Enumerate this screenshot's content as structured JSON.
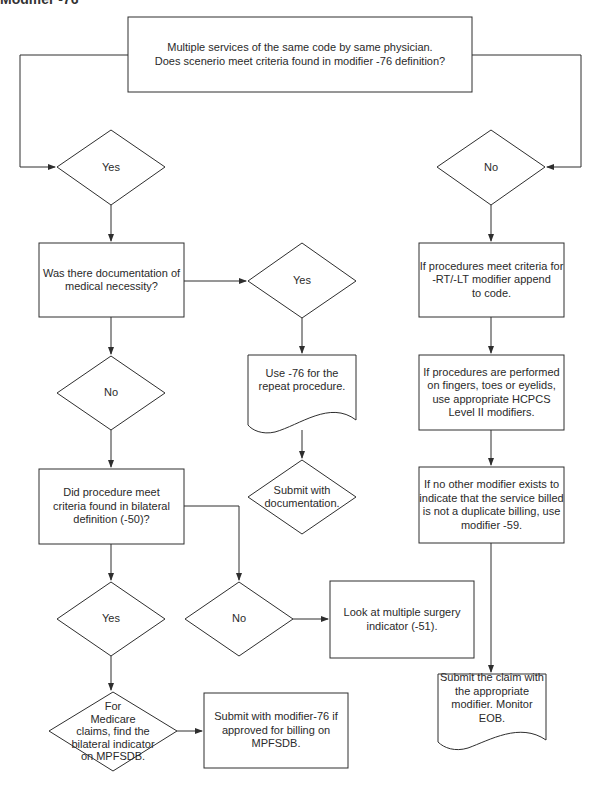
{
  "heading": "Modifier -76",
  "nodes": {
    "start": {
      "type": "process",
      "text": "Multiple services of the same code by same physician.\nDoes scenerio meet criteria found in modifier -76 definition?"
    },
    "yes1": {
      "type": "decision",
      "text": "Yes"
    },
    "no1": {
      "type": "decision",
      "text": "No"
    },
    "med_necessity": {
      "type": "process",
      "text": "Was there documentation of\nmedical necessity?"
    },
    "yes2": {
      "type": "decision",
      "text": "Yes"
    },
    "use76": {
      "type": "document",
      "text": "Use -76 for the\nrepeat procedure."
    },
    "submit_doc": {
      "type": "decision",
      "text": "Submit with\ndocumentation."
    },
    "no2": {
      "type": "decision",
      "text": "No"
    },
    "bilateral": {
      "type": "process",
      "text": "Did procedure meet\ncriteria found in bilateral\ndefinition (-50)?"
    },
    "yes3": {
      "type": "decision",
      "text": "Yes"
    },
    "no3": {
      "type": "decision",
      "text": "No"
    },
    "multi_surgery": {
      "type": "process",
      "text": "Look at multiple surgery\nindicator (-51)."
    },
    "medicare": {
      "type": "decision",
      "text": "For\nMedicare\nclaims, find the\nbilateral indicator\non MPFSDB."
    },
    "submit76": {
      "type": "process",
      "text": "Submit with modifier-76 if\napproved for billing on\nMPFSDB."
    },
    "rtlt": {
      "type": "process",
      "text": "If procedures meet criteria for\n-RT/-LT modifier append\nto code."
    },
    "hcpcs": {
      "type": "process",
      "text": "If procedures are performed\non fingers, toes or eyelids,\nuse appropriate HCPCS\nLevel II modifiers."
    },
    "mod59": {
      "type": "process",
      "text": "If no other modifier exists to\nindicate that the service billed\nis not a duplicate billing, use\nmodifier -59."
    },
    "submit_claim": {
      "type": "document",
      "text": "Submit the claim with\nthe appropriate\nmodifier.  Monitor EOB."
    }
  },
  "colors": {
    "stroke": "#2e2e2e",
    "text": "#2a2a2a",
    "background": "#ffffff"
  }
}
